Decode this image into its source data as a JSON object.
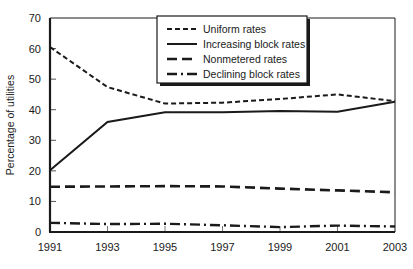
{
  "chart_data": {
    "type": "line",
    "title": "",
    "xlabel": "",
    "ylabel": "Percentage of utilities",
    "x": [
      1991,
      1993,
      1995,
      1997,
      1999,
      2001,
      2003
    ],
    "xtick_labels": [
      "1991",
      "1993",
      "1995",
      "1997",
      "1999",
      "2001",
      "2003"
    ],
    "ytick_labels": [
      "0",
      "10",
      "20",
      "30",
      "40",
      "50",
      "60",
      "70"
    ],
    "yticks": [
      0,
      10,
      20,
      30,
      40,
      50,
      60,
      70
    ],
    "xlim": [
      1991,
      2003
    ],
    "ylim": [
      0,
      70
    ],
    "grid": false,
    "legend_position": "top-center",
    "series": [
      {
        "name": "Uniform rates",
        "dash": "dotted",
        "values": [
          60.5,
          47.4,
          42.0,
          42.3,
          43.5,
          45.0,
          42.8
        ]
      },
      {
        "name": "Increasing block rates",
        "dash": "solid",
        "values": [
          20.2,
          36.0,
          39.2,
          39.2,
          39.6,
          39.3,
          42.6
        ]
      },
      {
        "name": "Nonmetered rates",
        "dash": "dashed",
        "values": [
          14.8,
          14.9,
          15.0,
          14.9,
          14.2,
          13.6,
          13.0
        ]
      },
      {
        "name": "Declining block rates",
        "dash": "dashdot",
        "values": [
          3.0,
          2.6,
          2.7,
          2.2,
          1.6,
          2.1,
          1.8
        ]
      }
    ]
  },
  "axes": {
    "y_title": "Percentage of utilities"
  },
  "legend": {
    "entries": [
      {
        "label": "Uniform rates"
      },
      {
        "label": "Increasing block rates"
      },
      {
        "label": "Nonmetered rates"
      },
      {
        "label": "Declining block rates"
      }
    ]
  },
  "colors": {
    "ink": "#1a1a1a",
    "background": "#ffffff"
  }
}
